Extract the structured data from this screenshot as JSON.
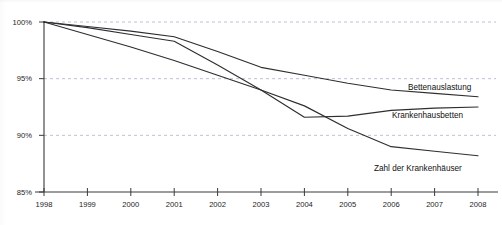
{
  "chart_data": {
    "type": "line",
    "title": "",
    "xlabel": "",
    "ylabel": "",
    "x": [
      1998,
      1999,
      2000,
      2001,
      2002,
      2003,
      2004,
      2005,
      2006,
      2007,
      2008
    ],
    "xlim": [
      1998,
      2008
    ],
    "ylim": [
      85,
      100
    ],
    "yticks": [
      85,
      90,
      95,
      100
    ],
    "ytick_labels": [
      "85%",
      "90%",
      "95%",
      "100%"
    ],
    "xtick_labels": [
      "1998",
      "1999",
      "2000",
      "2001",
      "2002",
      "2003",
      "2004",
      "2005",
      "2006",
      "2007",
      "2008"
    ],
    "grid": true,
    "grid_axis": "y",
    "legend": "inline-right-labels",
    "series": [
      {
        "name": "Bettenauslastung",
        "values": [
          100.0,
          99.6,
          99.2,
          98.7,
          97.4,
          96.0,
          95.3,
          94.6,
          94.0,
          93.7,
          93.4
        ]
      },
      {
        "name": "Krankenhausbetten",
        "values": [
          100.0,
          99.5,
          98.9,
          98.3,
          96.2,
          94.0,
          91.6,
          91.7,
          92.2,
          92.4,
          92.5
        ]
      },
      {
        "name": "Zahl der Krankenhäuser",
        "values": [
          100.0,
          98.9,
          97.8,
          96.6,
          95.3,
          94.0,
          92.6,
          90.6,
          89.0,
          88.6,
          88.2
        ]
      }
    ],
    "series_labels": [
      {
        "text": "Bettenauslastung",
        "value_ref": "Bettenauslastung"
      },
      {
        "text": "Krankenhausbetten",
        "value_ref": "Krankenhausbetten"
      },
      {
        "text": "Zahl der Krankenhäuser",
        "value_ref": "Zahl der Krankenhäuser"
      }
    ],
    "colors": {
      "line": "#2e2e2e",
      "axis": "#3a3a3a",
      "grid": "#b9b9cf",
      "background": "#ffffff",
      "text": "#111111"
    }
  }
}
